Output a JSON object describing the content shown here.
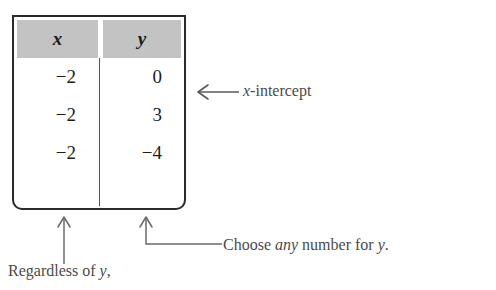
{
  "table": {
    "headers": [
      "x",
      "y"
    ],
    "rows": [
      {
        "x": "−2",
        "y": "0"
      },
      {
        "x": "−2",
        "y": "3"
      },
      {
        "x": "−2",
        "y": "−4"
      }
    ],
    "header_bg": "#c3c3c3",
    "border_color": "#2b2b2b"
  },
  "annotations": {
    "x_intercept": {
      "prefix": "x",
      "suffix": "-intercept",
      "arrow": "left-arrow-icon"
    },
    "regardless": {
      "prefix": "Regardless of ",
      "variable": "y",
      "suffix": ",",
      "arrow": "up-arrow-icon"
    },
    "choose": {
      "prefix": "Choose ",
      "emphasis": "any",
      "middle": " number for ",
      "variable": "y",
      "suffix": ".",
      "arrow": "up-arrow-elbow-icon"
    }
  }
}
